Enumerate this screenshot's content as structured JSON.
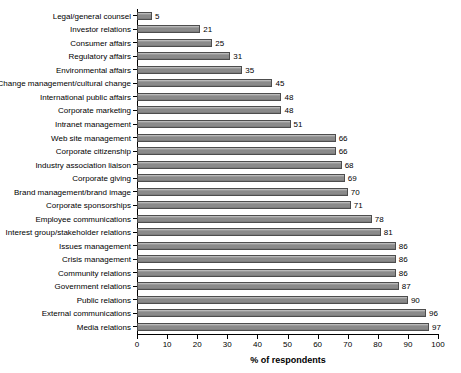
{
  "chart_data": {
    "type": "bar",
    "orientation": "horizontal",
    "title": "",
    "subtitle": "",
    "xlabel": "% of respondents",
    "ylabel": "",
    "xlim": [
      0,
      100
    ],
    "xticks": [
      0,
      10,
      20,
      30,
      40,
      50,
      60,
      70,
      80,
      90,
      100
    ],
    "grid": false,
    "legend": null,
    "show_value_labels": true,
    "bar_color": "#8a8a8a",
    "bar_edge_color": "#4d4d4d",
    "background_color": "#ffffff",
    "categories": [
      "Legal/general counsel",
      "Investor relations",
      "Consumer affairs",
      "Regulatory affairs",
      "Environmental affairs",
      "Change management/cultural change",
      "International public affairs",
      "Corporate marketing",
      "Intranet management",
      "Web site management",
      "Corporate citizenship",
      "Industry association liaison",
      "Corporate giving",
      "Brand management/brand image",
      "Corporate sponsorships",
      "Employee communications",
      "Interest group/stakeholder relations",
      "Issues management",
      "Crisis management",
      "Community relations",
      "Government relations",
      "Public relations",
      "External communications",
      "Media relations"
    ],
    "values": [
      5,
      21,
      25,
      31,
      35,
      45,
      48,
      48,
      51,
      66,
      66,
      68,
      69,
      70,
      71,
      78,
      81,
      86,
      86,
      86,
      87,
      90,
      96,
      97
    ]
  }
}
